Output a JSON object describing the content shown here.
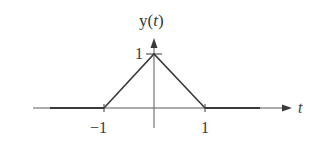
{
  "figure": {
    "y_axis_label_prefix": "y(",
    "y_axis_label_var": "t",
    "y_axis_label_suffix": ")",
    "x_axis_label": "t",
    "y_tick_label": "1",
    "x_tick_labels": [
      "−1",
      "1"
    ],
    "signal": "triangular pulse",
    "points": [
      [
        -1,
        0
      ],
      [
        0,
        1
      ],
      [
        1,
        0
      ]
    ],
    "colors": {
      "line": "#3a3a3a",
      "axis": "#5a5a5a",
      "background": "#ffffff"
    }
  }
}
